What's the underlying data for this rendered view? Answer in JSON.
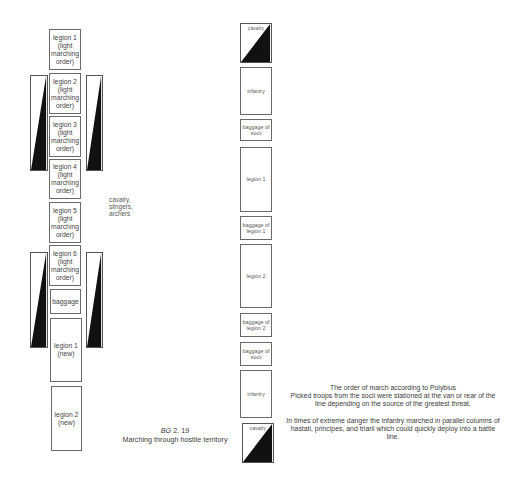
{
  "left_diagram": {
    "title_ref": "BG",
    "title_num": "2. 19",
    "subtitle": "Marching through hostile territory",
    "column": [
      {
        "label": "legion  1\n(light\nmarching\norder)"
      },
      {
        "label": "legion  2\n(light\nmarching\norder)"
      },
      {
        "label": "legion  3\n(light\nmarching\norder)"
      },
      {
        "label": "legion  4\n(light\nmarching\norder)"
      },
      {
        "label": "legion  5\n(light\nmarching\norder)"
      },
      {
        "label": "legion  6\n(light\nmarching\norder)"
      },
      {
        "label": "baggage"
      },
      {
        "label": "legion 1\n(new)"
      },
      {
        "label": "legion 2\n(new)"
      }
    ],
    "flank_note": "cavalry,\nslingers,\narchers",
    "flank_icon": "cavalry-flank-wedge-icon"
  },
  "right_diagram": {
    "column": [
      {
        "label": "cavalry",
        "type": "cavalry"
      },
      {
        "label": "infantry"
      },
      {
        "label": "baggage of\nsocii"
      },
      {
        "label": "legion 1"
      },
      {
        "label": "baggage of\nlegion 1"
      },
      {
        "label": "legion 2"
      },
      {
        "label": "baggage of\nlegion 2"
      },
      {
        "label": "baggage of\nsocii"
      },
      {
        "label": "infantry"
      },
      {
        "label": "cavalry",
        "type": "cavalry"
      }
    ],
    "caption": {
      "title": "The order of march according to Polybius",
      "line1": "Picked troops from the socii were stationed at the van or rear of the line depending on the source of the greatest threat.",
      "para2": "In times of extreme danger the infantry marched in parallel columns of hastati, principes, and triarii which could quickly deploy into a battle line."
    }
  },
  "colors": {
    "fill": "#111111",
    "outline": "#555555",
    "text": "#3a3a3a"
  }
}
